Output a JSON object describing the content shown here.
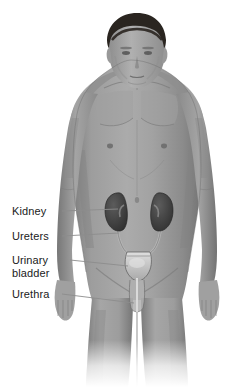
{
  "figure": {
    "background_color": "#ffffff",
    "body_color": "#9a9a9a",
    "hair_color": "#2a2520",
    "organ_color": "#4a4a4a",
    "bladder_color": "#c9c9c9",
    "leader_line_color": "#8c8c8c",
    "text_color": "#1a1a1a"
  },
  "labels": [
    {
      "id": "kidney",
      "text": "Kidney",
      "line1": "Kidney",
      "line2": ""
    },
    {
      "id": "ureters",
      "text": "Ureters",
      "line1": "Ureters",
      "line2": ""
    },
    {
      "id": "bladder",
      "text": "Urinary bladder",
      "line1": "Urinary",
      "line2": "bladder"
    },
    {
      "id": "urethra",
      "text": "Urethra",
      "line1": "Urethra",
      "line2": ""
    }
  ],
  "structures": [
    {
      "name": "kidney-left",
      "label": "Kidney"
    },
    {
      "name": "kidney-right",
      "label": "Kidney"
    },
    {
      "name": "ureter-left",
      "label": "Ureters"
    },
    {
      "name": "ureter-right",
      "label": "Ureters"
    },
    {
      "name": "urinary-bladder",
      "label": "Urinary bladder"
    },
    {
      "name": "urethra",
      "label": "Urethra"
    }
  ]
}
